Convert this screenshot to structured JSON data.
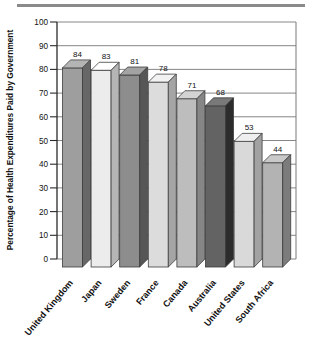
{
  "figure": {
    "background": "#ffffff",
    "top_rule_color": "#8a8a8a"
  },
  "chart_data": {
    "type": "bar",
    "style": "3d-grayscale",
    "title": "",
    "xlabel": "",
    "ylabel": "Percentage of Health Expenditures Paid by Government",
    "ylim": [
      0,
      100
    ],
    "ytick_interval": 10,
    "yticks": [
      100,
      90,
      80,
      70,
      60,
      50,
      40,
      30,
      20,
      10,
      0
    ],
    "categories": [
      "United Kingdom",
      "Japan",
      "Sweden",
      "France",
      "Canada",
      "Australia",
      "United States",
      "South Africa"
    ],
    "values": [
      84,
      83,
      81,
      78,
      71,
      68,
      53,
      44
    ],
    "value_labels": [
      "84",
      "83",
      "81",
      "78",
      "71",
      "68",
      "53",
      "44"
    ],
    "bar_front_colors": [
      "#9e9e9e",
      "#ececec",
      "#8d8d8d",
      "#dcdcdc",
      "#bdbdbd",
      "#636363",
      "#d9d9d9",
      "#b3b3b3"
    ],
    "grid": true,
    "legend": false,
    "gridline_color": "#787878",
    "axis_color": "#2a2a2a",
    "bar_outline_color": "#3d3d3d",
    "text_color": "#111111"
  }
}
